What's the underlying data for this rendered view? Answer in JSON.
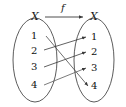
{
  "diagram": {
    "type": "function-mapping-diagram",
    "map_label": "f",
    "domain_set": {
      "label": "X",
      "elements": [
        "1",
        "2",
        "3",
        "4"
      ]
    },
    "codomain_set": {
      "label": "X",
      "elements": [
        "1",
        "2",
        "3",
        "4"
      ]
    },
    "arrows": [
      {
        "from": "1",
        "to": "4"
      },
      {
        "from": "2",
        "to": "1"
      },
      {
        "from": "3",
        "to": "2"
      },
      {
        "from": "4",
        "to": "3"
      }
    ],
    "colors": {
      "stroke": "#3a3a3a",
      "text": "#111111",
      "background": "#ffffff"
    }
  }
}
